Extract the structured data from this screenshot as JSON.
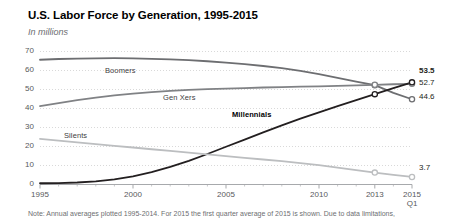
{
  "header": {
    "title": "U.S. Labor Force by Generation, 1995-2015",
    "subtitle": "In millions"
  },
  "note": "Note: Annual averages plotted 1995-2014. For 2015 the first quarter average of 2015 is shown. Due to data limitations,",
  "axis": {
    "y_ticks": [
      "70",
      "60",
      "50",
      "40",
      "30",
      "20",
      "10",
      "0"
    ],
    "x_ticks": [
      "1995",
      "2000",
      "2005",
      "2010",
      "2013",
      "2015"
    ],
    "x_last_sub": "Q1"
  },
  "series_labels": {
    "boomers": "Boomers",
    "genxers": "Gen Xers",
    "millennials": "Millennials",
    "silents": "Silents"
  },
  "end_labels": {
    "millennials": "53.5",
    "genxers": "52.7",
    "boomers": "44.6",
    "silents": "3.7"
  },
  "colors": {
    "millennials": "#231f20",
    "boomers": "#6d6e71",
    "genxers": "#808285",
    "silents": "#bcbec0",
    "grid": "#d9d9d9",
    "axis": "#a7a9ac",
    "title": "#000000",
    "muted": "#6d6e71"
  },
  "chart_data": {
    "type": "line",
    "title": "U.S. Labor Force by Generation, 1995-2015",
    "subtitle": "In millions",
    "xlabel": "",
    "ylabel": "In millions",
    "ylim": [
      0,
      70
    ],
    "xlim": [
      1995,
      2015
    ],
    "grid": true,
    "legend": "inline-labels",
    "x": [
      1995,
      1996,
      1997,
      1998,
      1999,
      2000,
      2001,
      2002,
      2003,
      2004,
      2005,
      2006,
      2007,
      2008,
      2009,
      2010,
      2011,
      2012,
      2013,
      2014,
      2015
    ],
    "series": [
      {
        "name": "Boomers",
        "color": "#6d6e71",
        "end_value": 44.6,
        "values": [
          65.4,
          65.8,
          66.0,
          66.1,
          66.2,
          66.1,
          65.9,
          65.6,
          65.2,
          64.6,
          63.9,
          63.1,
          62.1,
          61.0,
          59.5,
          57.8,
          55.9,
          53.9,
          52.0,
          48.0,
          44.6
        ]
      },
      {
        "name": "Gen Xers",
        "color": "#808285",
        "end_value": 52.7,
        "values": [
          41.0,
          42.6,
          44.1,
          45.5,
          46.6,
          47.6,
          48.4,
          49.0,
          49.5,
          49.9,
          50.2,
          50.5,
          50.8,
          51.0,
          51.2,
          51.4,
          51.6,
          51.9,
          52.2,
          52.5,
          52.7
        ]
      },
      {
        "name": "Millennials",
        "color": "#231f20",
        "end_value": 53.5,
        "values": [
          0.4,
          0.5,
          0.8,
          1.4,
          2.4,
          4.0,
          6.2,
          9.0,
          12.2,
          15.8,
          19.6,
          23.4,
          27.2,
          30.9,
          34.4,
          37.7,
          41.0,
          44.2,
          47.3,
          50.5,
          53.5
        ]
      },
      {
        "name": "Silents",
        "color": "#bcbec0",
        "end_value": 3.7,
        "values": [
          23.8,
          22.8,
          21.9,
          21.0,
          20.1,
          19.2,
          18.3,
          17.4,
          16.5,
          15.6,
          14.7,
          13.8,
          12.9,
          12.0,
          11.0,
          9.9,
          8.6,
          7.3,
          6.0,
          4.8,
          3.7
        ]
      }
    ],
    "markers_at": [
      2013,
      2015
    ],
    "marker_style": "open-circle"
  }
}
